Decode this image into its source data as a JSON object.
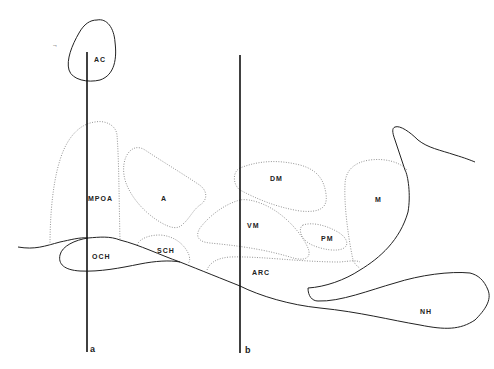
{
  "diagram": {
    "type": "sagittal brain section (hypothalamus)",
    "regions": [
      {
        "id": "AC",
        "label": "AC"
      },
      {
        "id": "MPOA",
        "label": "MPOA"
      },
      {
        "id": "A",
        "label": "A"
      },
      {
        "id": "DM",
        "label": "DM"
      },
      {
        "id": "M",
        "label": "M"
      },
      {
        "id": "VM",
        "label": "VM"
      },
      {
        "id": "PM",
        "label": "PM"
      },
      {
        "id": "OCH",
        "label": "OCH"
      },
      {
        "id": "SCH",
        "label": "SCH"
      },
      {
        "id": "ARC",
        "label": "ARC"
      },
      {
        "id": "NH",
        "label": "NH"
      }
    ],
    "cut_lines": [
      {
        "id": "a",
        "label": "a"
      },
      {
        "id": "b",
        "label": "b"
      }
    ],
    "corner_mark": "→",
    "colors": {
      "solid_outline": "#222222",
      "dotted_outline": "#888888",
      "background": "#ffffff"
    }
  }
}
